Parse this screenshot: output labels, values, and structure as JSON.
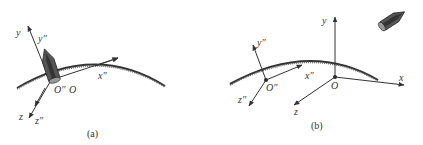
{
  "panel_a": {
    "caption": "(a)",
    "labels": {
      "y": "y",
      "y_prime": "y″",
      "x_prime": "x″",
      "z": "z",
      "z_prime": "z″",
      "origin_prime": "O″",
      "origin": "O"
    }
  },
  "panel_b": {
    "caption": "(b)",
    "labels": {
      "y": "y",
      "y_prime": "y″",
      "x_prime": "x″",
      "x": "x",
      "z": "z",
      "z_prime": "z″",
      "origin_prime": "O″",
      "origin": "O"
    }
  },
  "colors": {
    "line": "#333333",
    "rocket_body": "#555555",
    "rocket_dark": "#333333",
    "rocket_light": "#999999"
  }
}
